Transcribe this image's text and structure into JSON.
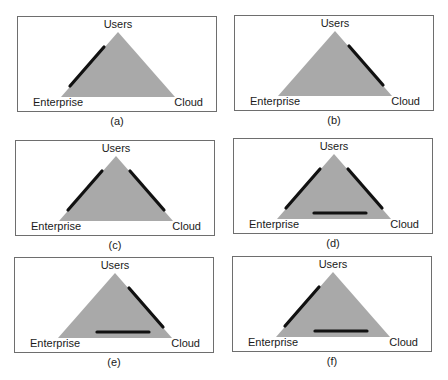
{
  "figure": {
    "colors": {
      "triangle_fill": "#a9a9a9",
      "bar_color": "#111111",
      "border_color": "#6e6e6e"
    },
    "vertex_labels": {
      "top": "Users",
      "bottom_left": "Enterprise",
      "bottom_right": "Cloud"
    },
    "panels": [
      {
        "caption": "(a)",
        "users": "Users",
        "enterprise": "Enterprise",
        "cloud": "Cloud",
        "highlighted_edges": [
          "users-enterprise"
        ]
      },
      {
        "caption": "(b)",
        "users": "Users",
        "enterprise": "Enterprise",
        "cloud": "Cloud",
        "highlighted_edges": [
          "users-cloud"
        ]
      },
      {
        "caption": "(c)",
        "users": "Users",
        "enterprise": "Enterprise",
        "cloud": "Cloud",
        "highlighted_edges": [
          "users-enterprise",
          "users-cloud"
        ]
      },
      {
        "caption": "(d)",
        "users": "Users",
        "enterprise": "Enterprise",
        "cloud": "Cloud",
        "highlighted_edges": [
          "users-enterprise",
          "users-cloud",
          "enterprise-cloud"
        ]
      },
      {
        "caption": "(e)",
        "users": "Users",
        "enterprise": "Enterprise",
        "cloud": "Cloud",
        "highlighted_edges": [
          "users-cloud",
          "enterprise-cloud"
        ]
      },
      {
        "caption": "(f)",
        "users": "Users",
        "enterprise": "Enterprise",
        "cloud": "Cloud",
        "highlighted_edges": [
          "users-enterprise",
          "enterprise-cloud"
        ]
      }
    ]
  }
}
